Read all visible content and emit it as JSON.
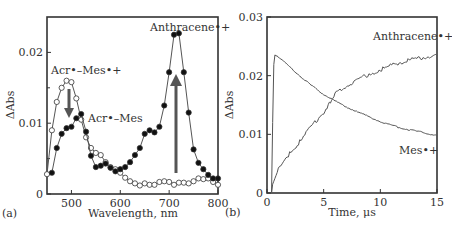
{
  "chart_data": [
    {
      "panel": "(a)",
      "type": "line",
      "title": "",
      "xlabel": "Wavelength, nm",
      "ylabel": "ΔAbs",
      "xlim": [
        450,
        800
      ],
      "ylim": [
        0,
        0.025
      ],
      "xticks": [
        500,
        600,
        700,
        800
      ],
      "yticks": [
        0,
        0.01,
        0.02
      ],
      "ytick_labels": [
        "0",
        "0.01",
        "0.02"
      ],
      "grid": false,
      "series": [
        {
          "name": "Acr•–Mes•+",
          "marker": "open-circle",
          "x": [
            450,
            460,
            470,
            480,
            490,
            500,
            510,
            520,
            530,
            540,
            550,
            560,
            570,
            580,
            590,
            600,
            610,
            620,
            630,
            640,
            650,
            660,
            670,
            680,
            690,
            700,
            710,
            720,
            730,
            740,
            750,
            760,
            770,
            780,
            790,
            800
          ],
          "values": [
            0.0028,
            0.009,
            0.013,
            0.015,
            0.016,
            0.0158,
            0.0135,
            0.0105,
            0.008,
            0.0065,
            0.0058,
            0.0055,
            0.0045,
            0.0038,
            0.0035,
            0.003,
            0.0023,
            0.0018,
            0.0015,
            0.0012,
            0.0015,
            0.0013,
            0.0013,
            0.0017,
            0.0018,
            0.0017,
            0.0013,
            0.0016,
            0.0016,
            0.0015,
            0.0018,
            0.0022,
            0.0021,
            0.0022,
            0.0017,
            0.0013
          ]
        },
        {
          "name": "Acr•–Mes",
          "marker": "filled-circle",
          "x": [
            460,
            470,
            480,
            490,
            500,
            510,
            520,
            530,
            540,
            550,
            560,
            570,
            580,
            590,
            600,
            610,
            620,
            630,
            640,
            650,
            660,
            670,
            680,
            690,
            700,
            710,
            720,
            730,
            740,
            750,
            760,
            770,
            780,
            790,
            800
          ],
          "values": [
            0.003,
            0.0065,
            0.0085,
            0.0093,
            0.0095,
            0.0107,
            0.0113,
            0.0088,
            0.0054,
            0.0038,
            0.004,
            0.0043,
            0.0037,
            0.0032,
            0.0035,
            0.0038,
            0.0045,
            0.0055,
            0.0065,
            0.0085,
            0.009,
            0.0087,
            0.0095,
            0.0125,
            0.0172,
            0.0225,
            0.0227,
            0.0172,
            0.0115,
            0.0063,
            0.0044,
            0.0035,
            0.0027,
            0.0022,
            0.0022
          ]
        }
      ],
      "annotations": [
        {
          "text": "Anthracene•+",
          "x": 720,
          "y": 0.0235
        },
        {
          "text": "Acr•–Mes•+",
          "x": 475,
          "y": 0.018
        },
        {
          "text": "Acr•–Mes",
          "x": 555,
          "y": 0.0108
        },
        {
          "type": "arrow-down",
          "x": 490,
          "from": 0.015,
          "to": 0.0108
        },
        {
          "type": "arrow-up",
          "x": 712,
          "from": 0.003,
          "to": 0.017
        }
      ]
    },
    {
      "panel": "(b)",
      "type": "line",
      "title": "",
      "xlabel": "Time, μs",
      "ylabel": "ΔAbs",
      "xlim": [
        0,
        15
      ],
      "ylim": [
        0,
        0.03
      ],
      "xticks": [
        0,
        5,
        10,
        15
      ],
      "yticks": [
        0,
        0.01,
        0.02,
        0.03
      ],
      "ytick_labels": [
        "0",
        "0.01",
        "0.02",
        "0.03"
      ],
      "grid": false,
      "series": [
        {
          "name": "Mes•+",
          "x": [
            0.4,
            0.5,
            0.6,
            0.7,
            1,
            2,
            3,
            4,
            5,
            6,
            7,
            8,
            9,
            10,
            11,
            12,
            13,
            14,
            15
          ],
          "values": [
            0,
            0.012,
            0.022,
            0.0236,
            0.0232,
            0.0215,
            0.0198,
            0.0182,
            0.0168,
            0.0157,
            0.0147,
            0.0138,
            0.013,
            0.0122,
            0.0115,
            0.011,
            0.0106,
            0.0102,
            0.0098
          ]
        },
        {
          "name": "Anthracene•+",
          "x": [
            0.4,
            0.5,
            1,
            2,
            3,
            4,
            5,
            5.5,
            6,
            7,
            8,
            9,
            10,
            11,
            12,
            13,
            14,
            15
          ],
          "values": [
            0,
            0.0015,
            0.004,
            0.0068,
            0.009,
            0.0115,
            0.0138,
            0.0152,
            0.0168,
            0.0183,
            0.0193,
            0.0202,
            0.021,
            0.0218,
            0.0224,
            0.0228,
            0.0232,
            0.0234
          ]
        }
      ],
      "annotations": [
        {
          "text": "Anthracene•+",
          "x": 12,
          "y": 0.0265
        },
        {
          "text": "Mes•+",
          "x": 12.5,
          "y": 0.0075
        }
      ]
    }
  ],
  "figure": {
    "panel_a": {
      "label": "(a)",
      "xlabel": "Wavelength, nm",
      "ylabel": "ΔAbs",
      "xticks": [
        "500",
        "600",
        "700",
        "800"
      ],
      "yticks": [
        "0",
        "0.01",
        "0.02"
      ],
      "ann_anthracene": "Anthracene•+",
      "ann_acr_mes_cation": "Acr•–Mes•+",
      "ann_acr_mes": "Acr•–Mes"
    },
    "panel_b": {
      "label": "(b)",
      "xlabel": "Time, μs",
      "ylabel": "ΔAbs",
      "xticks": [
        "0",
        "5",
        "10",
        "15"
      ],
      "yticks": [
        "0",
        "0.01",
        "0.02",
        "0.03"
      ],
      "ann_anthracene": "Anthracene•+",
      "ann_mes": "Mes•+"
    }
  }
}
